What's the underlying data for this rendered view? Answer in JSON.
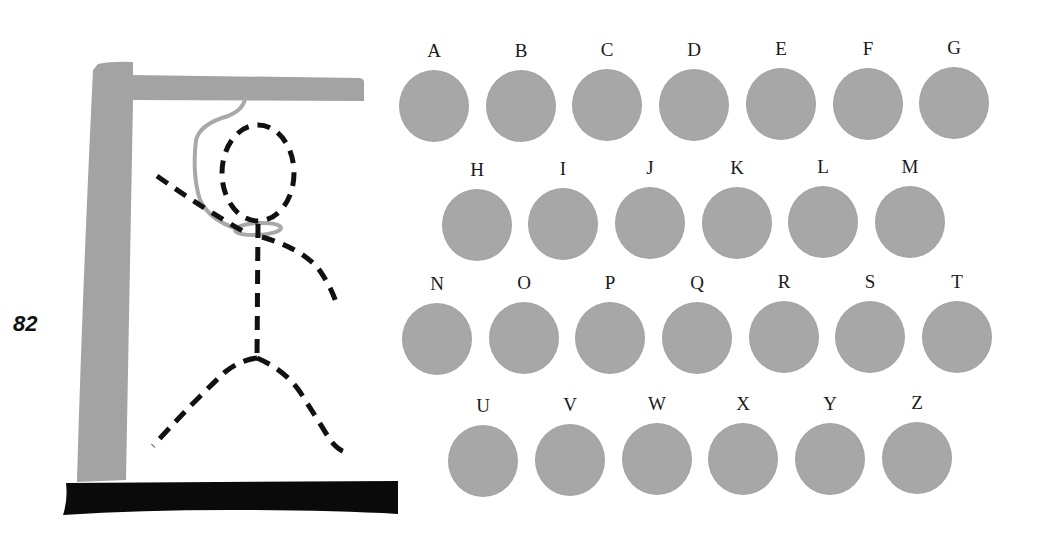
{
  "page": {
    "page_number": "82"
  },
  "colors": {
    "gallows_gray": "#a3a3a3",
    "base_black": "#0a0a0a",
    "figure_black": "#111111",
    "rope_gray": "#a8a8a8",
    "disc_gray": "#a7a7a7",
    "label_text": "#1a1a1a"
  },
  "hangman": {
    "parts_drawn": [
      "gallows-post",
      "gallows-beam",
      "gallows-base",
      "rope-noose",
      "head",
      "body",
      "left-arm",
      "right-arm",
      "left-leg",
      "right-leg"
    ],
    "figure_style": "dashed"
  },
  "alphabet": {
    "rows": [
      [
        {
          "letter": "A",
          "cx": 434,
          "cy": 106
        },
        {
          "letter": "B",
          "cx": 521,
          "cy": 106
        },
        {
          "letter": "C",
          "cx": 607,
          "cy": 105
        },
        {
          "letter": "D",
          "cx": 694,
          "cy": 105
        },
        {
          "letter": "E",
          "cx": 781,
          "cy": 104
        },
        {
          "letter": "F",
          "cx": 868,
          "cy": 104
        },
        {
          "letter": "G",
          "cx": 954,
          "cy": 103
        }
      ],
      [
        {
          "letter": "H",
          "cx": 477,
          "cy": 225
        },
        {
          "letter": "I",
          "cx": 563,
          "cy": 224
        },
        {
          "letter": "J",
          "cx": 650,
          "cy": 223
        },
        {
          "letter": "K",
          "cx": 737,
          "cy": 223
        },
        {
          "letter": "L",
          "cx": 823,
          "cy": 222
        },
        {
          "letter": "M",
          "cx": 910,
          "cy": 222
        }
      ],
      [
        {
          "letter": "N",
          "cx": 437,
          "cy": 339
        },
        {
          "letter": "O",
          "cx": 524,
          "cy": 338
        },
        {
          "letter": "P",
          "cx": 610,
          "cy": 338
        },
        {
          "letter": "Q",
          "cx": 697,
          "cy": 338
        },
        {
          "letter": "R",
          "cx": 784,
          "cy": 337
        },
        {
          "letter": "S",
          "cx": 870,
          "cy": 337
        },
        {
          "letter": "T",
          "cx": 957,
          "cy": 337
        }
      ],
      [
        {
          "letter": "U",
          "cx": 483,
          "cy": 461
        },
        {
          "letter": "V",
          "cx": 570,
          "cy": 460
        },
        {
          "letter": "W",
          "cx": 657,
          "cy": 459
        },
        {
          "letter": "X",
          "cx": 743,
          "cy": 459
        },
        {
          "letter": "Y",
          "cx": 830,
          "cy": 459
        },
        {
          "letter": "Z",
          "cx": 917,
          "cy": 458
        }
      ]
    ]
  }
}
